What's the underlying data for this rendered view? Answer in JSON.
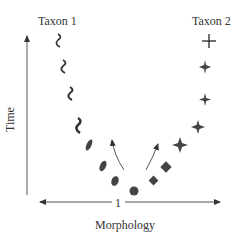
{
  "labels": {
    "taxon1": "Taxon 1",
    "taxon2": "Taxon 2",
    "x_axis": "Morphology",
    "y_axis": "Time",
    "origin_tick": "1"
  },
  "colors": {
    "ink": "#333333",
    "marker": "#444444"
  },
  "taxon1_markers": [
    "squiggle",
    "squiggle",
    "squiggle",
    "squiggle",
    "bar",
    "oval",
    "oval"
  ],
  "taxon2_markers": [
    "plus",
    "star4",
    "star4",
    "star4",
    "diamond",
    "diamond"
  ],
  "ancestor_marker": "circle"
}
